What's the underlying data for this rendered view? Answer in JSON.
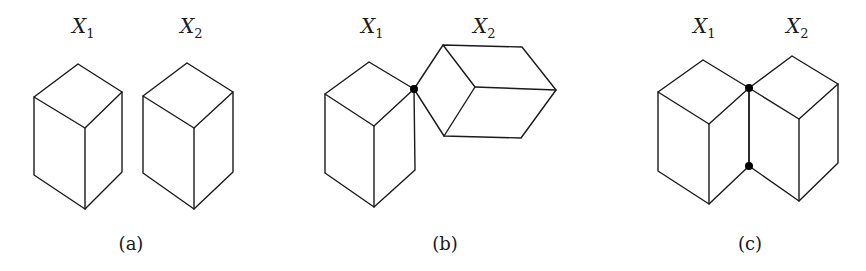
{
  "panels": [
    {
      "id": "a",
      "caption": "(a)",
      "caption_pos": [
        131,
        250
      ],
      "labels": [
        {
          "var": "X",
          "sub": "1",
          "pos": [
            72,
            33
          ]
        },
        {
          "var": "X",
          "sub": "2",
          "pos": [
            180,
            33
          ]
        }
      ],
      "boxes": [
        {
          "name": "X1",
          "vertices": {
            "top": [
              78,
              64
            ],
            "left": [
              34,
              97
            ],
            "right": [
              122,
              92
            ],
            "center": [
              85,
              128
            ],
            "bottom_left": [
              34,
              175
            ],
            "bottom": [
              85,
              209
            ],
            "bottom_right": [
              122,
              172
            ]
          }
        },
        {
          "name": "X2",
          "vertices": {
            "top": [
              187,
              63
            ],
            "left": [
              143,
              96
            ],
            "right": [
              233,
              92
            ],
            "center": [
              194,
              128
            ],
            "bottom_left": [
              143,
              173
            ],
            "bottom": [
              194,
              209
            ],
            "bottom_right": [
              233,
              172
            ]
          }
        }
      ],
      "contact_points": []
    },
    {
      "id": "b",
      "caption": "(b)",
      "caption_pos": [
        445,
        250
      ],
      "labels": [
        {
          "var": "X",
          "sub": "1",
          "pos": [
            361,
            33
          ]
        },
        {
          "var": "X",
          "sub": "2",
          "pos": [
            473,
            33
          ]
        }
      ],
      "boxes": [
        {
          "name": "X1",
          "vertices": {
            "top": [
              369,
              62
            ],
            "left": [
              325,
              94
            ],
            "right": [
              414,
              89
            ],
            "center": [
              374,
              126
            ],
            "bottom_left": [
              325,
              173
            ],
            "bottom": [
              374,
              207
            ],
            "bottom_right": [
              415,
              170
            ]
          }
        },
        {
          "name": "X2",
          "rotated": true,
          "vertices": {
            "joint": [
              414,
              89
            ],
            "top_left": [
              443,
              45
            ],
            "inner": [
              475,
              87
            ],
            "bottom_left": [
              444,
              136
            ],
            "top_right": [
              522,
              47
            ],
            "right": [
              556,
              90
            ],
            "bottom_right": [
              521,
              138
            ]
          }
        }
      ],
      "contact_points": [
        [
          414,
          89
        ]
      ]
    },
    {
      "id": "c",
      "caption": "(c)",
      "caption_pos": [
        750,
        250
      ],
      "labels": [
        {
          "var": "X",
          "sub": "1",
          "pos": [
            693,
            33
          ]
        },
        {
          "var": "X",
          "sub": "2",
          "pos": [
            786,
            33
          ]
        }
      ],
      "boxes": [
        {
          "name": "X1",
          "vertices": {
            "top": [
              703,
              60
            ],
            "left": [
              658,
              92
            ],
            "right": [
              749,
              88
            ],
            "center": [
              709,
              124
            ],
            "bottom_left": [
              658,
              171
            ],
            "bottom": [
              709,
              204
            ],
            "bottom_right": [
              749,
              166
            ]
          }
        },
        {
          "name": "X2",
          "vertices": {
            "top": [
              792,
              56
            ],
            "left": [
              749,
              88
            ],
            "right": [
              838,
              84
            ],
            "center": [
              799,
              119
            ],
            "bottom_left": [
              749,
              166
            ],
            "bottom": [
              799,
              201
            ],
            "bottom_right": [
              838,
              163
            ]
          }
        }
      ],
      "contact_points": [
        [
          749,
          88
        ],
        [
          749,
          166
        ]
      ]
    }
  ],
  "style": {
    "stroke_color": "#1a1a1a",
    "dot_color": "#000000",
    "dot_radius": 4,
    "background": "#ffffff"
  }
}
